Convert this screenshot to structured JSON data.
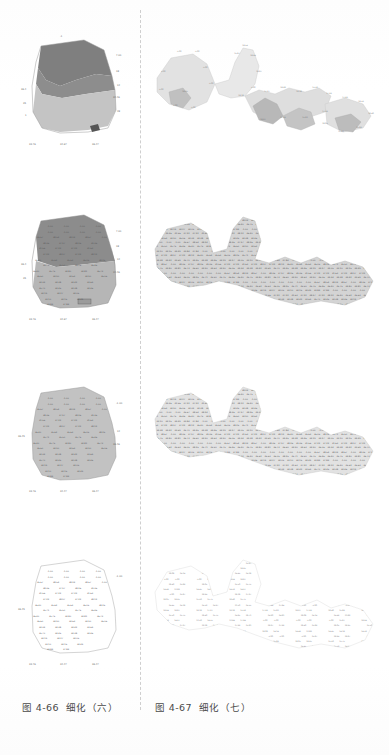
{
  "document": {
    "type": "scanned-book-page",
    "background_color": "#fefefe",
    "divider": {
      "style": "dashed-vertical",
      "color": "#cfcfcf"
    }
  },
  "captions": {
    "left": {
      "number": "图 4-66",
      "title": "细化（六）"
    },
    "right": {
      "number": "图 4-67",
      "title": "细化（七）"
    }
  },
  "palette": {
    "dark_gray": "#7f7f7f",
    "mid_gray": "#a0a0a0",
    "light_gray": "#c8c8c8",
    "pale_gray": "#dcdcdc",
    "very_pale": "#e8e8e8",
    "label_text": "#5a5a5a",
    "outline": "#8a8a8a"
  },
  "figures": {
    "left_column": [
      {
        "index": 1,
        "name": "map-left-1",
        "description": "polygon map with three shaded regions and sparse boundary coordinate labels",
        "fill_regions": [
          "#7f7f7f",
          "#a8a8a8",
          "#c8c8c8"
        ],
        "label_density": "sparse-boundary",
        "boundary_labels_top": [
          "-1.00"
        ],
        "boundary_labels_right": [
          "7.00",
          "18",
          "12",
          "34.46",
          "28"
        ],
        "boundary_labels_left": [
          "36.4",
          "35",
          "1"
        ],
        "axis_labels_bottom": [
          "33.76",
          "34.67",
          "36.47"
        ]
      },
      {
        "index": 2,
        "name": "map-left-2",
        "description": "same polygon, two-tone shading, full interior grid of numeric labels",
        "fill_regions": [
          "#8c8c8c",
          "#b4b4b4"
        ],
        "label_density": "full-grid",
        "axis_labels_bottom": [
          "33.76",
          "34.67",
          "36.47"
        ]
      },
      {
        "index": 3,
        "name": "map-left-3",
        "description": "same polygon, uniform light gray fill, full interior grid of numeric labels",
        "fill_regions": [
          "#c0c0c0"
        ],
        "label_density": "full-grid",
        "axis_labels_bottom": [
          "33.76",
          "34.67",
          "36.47"
        ]
      },
      {
        "index": 4,
        "name": "map-left-4",
        "description": "same polygon, white fill with thin outline, full interior grid of numeric labels",
        "fill_regions": [
          "#ffffff"
        ],
        "label_density": "full-grid",
        "axis_labels_bottom": [
          "33.76",
          "34.67",
          "36.47"
        ]
      }
    ],
    "right_column": [
      {
        "index": 1,
        "name": "map-right-1",
        "description": "wide irregular region map in pale grays with tiny boundary labels",
        "fill_regions": [
          "#e4e4e4",
          "#d2d2d2",
          "#bcbcbc",
          "#ededed"
        ],
        "label_density": "sparse-boundary"
      },
      {
        "index": 2,
        "name": "map-right-2",
        "description": "same wide region densely filled with tiny numeric labels, medium gray",
        "fill_regions": [
          "#cfcfcf"
        ],
        "label_density": "dense-fill"
      },
      {
        "index": 3,
        "name": "map-right-3",
        "description": "same wide region densely filled with tiny numeric labels, lighter gray",
        "fill_regions": [
          "#dcdcdc"
        ],
        "label_density": "dense-fill"
      },
      {
        "index": 4,
        "name": "map-right-4",
        "description": "same wide region sparsely filled with tiny numeric labels, very pale",
        "fill_regions": [
          "#ffffff"
        ],
        "label_density": "sparse-fill"
      }
    ]
  },
  "grid_values": {
    "row_01": [
      "-1.00",
      "-1.00",
      "-1.00",
      "-1.00"
    ],
    "row_02": [
      "-1.00",
      "-1.00",
      "-1.00",
      "-1.00"
    ],
    "row_03": [
      "35.67",
      "38.54",
      "38.24",
      "38.67",
      "-1.00"
    ],
    "row_04": [
      "38.36",
      "37.97",
      "38.26",
      "39.36"
    ],
    "row_05": [
      "31.56",
      "37.22",
      "37.22",
      "31.63"
    ],
    "row_06": [
      "37.22",
      "38.97",
      "37.22",
      "38.12"
    ],
    "row_07": [
      "36.40",
      "35.62",
      "35.63",
      "36.05",
      "38.25"
    ],
    "row_08": [
      "35.71",
      "35.50",
      "35.75",
      "36.46"
    ],
    "row_09": [
      "36.40",
      "35.75",
      "34.80",
      "34.81",
      "36.73"
    ],
    "row_10": [
      "36.60",
      "34.90",
      "34.63",
      "34.90",
      "36.06"
    ],
    "row_11": [
      "34.34",
      "34.38",
      "34.42",
      "33.69"
    ],
    "row_12": [
      "35.70",
      "34.45",
      "34.38",
      "34.46"
    ],
    "row_13": [
      "34.19",
      "34.27",
      "34.05"
    ],
    "row_14": [
      "33.10",
      "34.15",
      "34.49"
    ],
    "row_15": [
      "33.84",
      "37.84"
    ],
    "axis_bottom": [
      "33.76",
      "34.67",
      "36.47"
    ]
  }
}
